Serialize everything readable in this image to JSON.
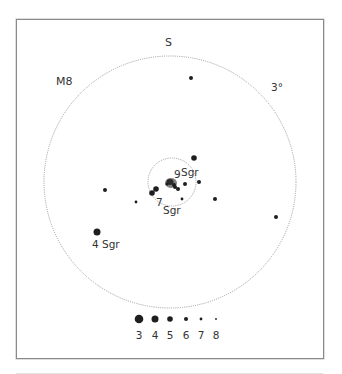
{
  "chart": {
    "object_label": "M8",
    "direction_label": "S",
    "scale_label": "3°",
    "colors": {
      "star": "#1e1e1e",
      "circle": "#9a9a9a",
      "frame": "#8a8a8a",
      "text": "#333333"
    },
    "fields": [
      {
        "name": "outer-field",
        "cx": 170,
        "cy": 182,
        "r": 126
      },
      {
        "name": "inner-field",
        "cx": 172,
        "cy": 182,
        "r": 24
      }
    ],
    "star_labels": [
      {
        "text": "9",
        "x": 174,
        "y": 178
      },
      {
        "text": "Sgr",
        "x": 181,
        "y": 176
      },
      {
        "text": "7",
        "x": 156,
        "y": 206
      },
      {
        "text": "Sgr",
        "x": 163,
        "y": 214
      },
      {
        "text": "4 Sgr",
        "x": 92,
        "y": 248
      }
    ],
    "stars": [
      {
        "x": 191,
        "y": 78,
        "mag": 6
      },
      {
        "x": 194,
        "y": 158,
        "mag": 5
      },
      {
        "x": 185,
        "y": 184,
        "mag": 6
      },
      {
        "x": 199,
        "y": 182,
        "mag": 6
      },
      {
        "x": 105,
        "y": 190,
        "mag": 6
      },
      {
        "x": 136,
        "y": 202,
        "mag": 7
      },
      {
        "x": 182,
        "y": 199,
        "mag": 7
      },
      {
        "x": 215,
        "y": 199,
        "mag": 6
      },
      {
        "x": 276,
        "y": 217,
        "mag": 6
      },
      {
        "x": 97,
        "y": 232,
        "mag": 4
      },
      {
        "x": 152,
        "y": 193,
        "mag": 5
      },
      {
        "x": 156,
        "y": 189,
        "mag": 5
      },
      {
        "x": 175,
        "y": 187,
        "mag": 6
      },
      {
        "x": 178,
        "y": 189,
        "mag": 6
      }
    ],
    "legend": {
      "title": "Magnitude",
      "items": [
        {
          "mag": "3",
          "x": 139,
          "r": 4.3
        },
        {
          "mag": "4",
          "x": 155,
          "r": 3.5
        },
        {
          "mag": "5",
          "x": 170,
          "r": 2.8
        },
        {
          "mag": "6",
          "x": 186,
          "r": 2.0
        },
        {
          "mag": "7",
          "x": 201,
          "r": 1.4
        },
        {
          "mag": "8",
          "x": 216,
          "r": 0.9
        }
      ]
    }
  }
}
